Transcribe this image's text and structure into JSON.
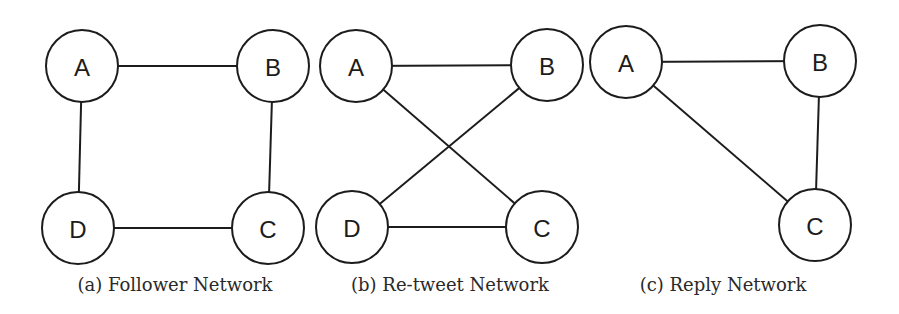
{
  "panels": [
    {
      "id": "a",
      "caption": "(a) Follower Network",
      "caption_x": 175,
      "nodes": [
        {
          "label": "A",
          "x": 82,
          "y": 66
        },
        {
          "label": "B",
          "x": 273,
          "y": 66
        },
        {
          "label": "C",
          "x": 268,
          "y": 228
        },
        {
          "label": "D",
          "x": 78,
          "y": 228
        }
      ],
      "edges": [
        [
          "A",
          "B"
        ],
        [
          "A",
          "D"
        ],
        [
          "B",
          "C"
        ],
        [
          "D",
          "C"
        ]
      ]
    },
    {
      "id": "b",
      "caption": "(b) Re-tweet Network",
      "caption_x": 450,
      "nodes": [
        {
          "label": "A",
          "x": 356,
          "y": 66
        },
        {
          "label": "B",
          "x": 547,
          "y": 65
        },
        {
          "label": "C",
          "x": 542,
          "y": 227
        },
        {
          "label": "D",
          "x": 352,
          "y": 227
        }
      ],
      "edges": [
        [
          "A",
          "B"
        ],
        [
          "A",
          "C"
        ],
        [
          "B",
          "D"
        ],
        [
          "D",
          "C"
        ]
      ]
    },
    {
      "id": "c",
      "caption": "(c) Reply Network",
      "caption_x": 723,
      "nodes": [
        {
          "label": "A",
          "x": 626,
          "y": 62
        },
        {
          "label": "B",
          "x": 820,
          "y": 61
        },
        {
          "label": "C",
          "x": 815,
          "y": 225
        }
      ],
      "edges": [
        [
          "A",
          "B"
        ],
        [
          "A",
          "C"
        ],
        [
          "B",
          "C"
        ]
      ]
    }
  ],
  "node_radius": 36
}
